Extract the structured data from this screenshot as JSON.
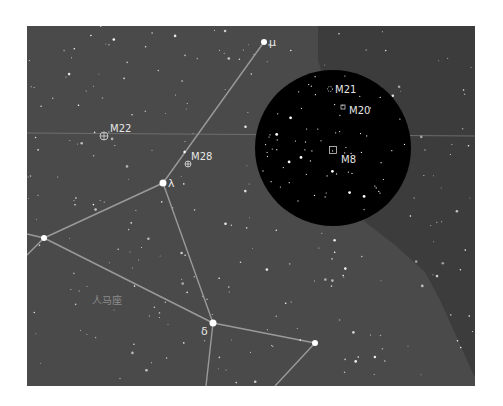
{
  "map": {
    "type": "star-chart",
    "constellation_label": "人马座",
    "frame": {
      "x": 27,
      "y": 26,
      "width": 448,
      "height": 360
    },
    "colors": {
      "page_background": "#ffffff",
      "sky": "#4a4a4a",
      "sky_dark_region": "#3c3c3c",
      "eyepiece_field": "#000000",
      "constellation_line": "#9a9a9a",
      "ecliptic_line": "#777777",
      "star": "#ffffff",
      "label": "#e6e6e6",
      "constellation_label_color": "#8a8a8a"
    },
    "eyepiece_circle": {
      "cx": 333,
      "cy": 148,
      "r": 78
    },
    "ecliptic": {
      "y_left": 133,
      "y_right": 136
    },
    "named_stars": [
      {
        "id": "mu",
        "label": "μ",
        "x": 264,
        "y": 42,
        "r": 3
      },
      {
        "id": "lambda",
        "label": "λ",
        "x": 163,
        "y": 183,
        "r": 3.5
      },
      {
        "id": "delta",
        "label": "δ",
        "x": 213,
        "y": 323,
        "r": 3.5
      },
      {
        "id": "phi",
        "label": "",
        "x": 44,
        "y": 238,
        "r": 3
      },
      {
        "id": "epsilon",
        "label": "",
        "x": 315,
        "y": 343,
        "r": 3
      }
    ],
    "constellation_lines": [
      {
        "x1": 264,
        "y1": 42,
        "x2": 163,
        "y2": 183
      },
      {
        "x1": 163,
        "y1": 183,
        "x2": 44,
        "y2": 238
      },
      {
        "x1": 163,
        "y1": 183,
        "x2": 213,
        "y2": 323
      },
      {
        "x1": 44,
        "y1": 238,
        "x2": 213,
        "y2": 323
      },
      {
        "x1": 44,
        "y1": 238,
        "x2": 27,
        "y2": 234
      },
      {
        "x1": 44,
        "y1": 238,
        "x2": 27,
        "y2": 255
      },
      {
        "x1": 213,
        "y1": 323,
        "x2": 315,
        "y2": 343
      },
      {
        "x1": 213,
        "y1": 323,
        "x2": 206,
        "y2": 386
      },
      {
        "x1": 315,
        "y1": 343,
        "x2": 275,
        "y2": 386
      }
    ],
    "deep_sky_objects": [
      {
        "id": "M22",
        "label": "M22",
        "symbol": "globular-cluster",
        "x": 104,
        "y": 136,
        "label_x": 110,
        "label_y": 132
      },
      {
        "id": "M28",
        "label": "M28",
        "symbol": "globular-cluster",
        "x": 188,
        "y": 164,
        "label_x": 191,
        "label_y": 160
      },
      {
        "id": "M21",
        "label": "M21",
        "symbol": "open-cluster",
        "x": 330,
        "y": 89,
        "label_x": 335,
        "label_y": 93
      },
      {
        "id": "M20",
        "label": "M20",
        "symbol": "nebula",
        "x": 343,
        "y": 107,
        "label_x": 349,
        "label_y": 114
      },
      {
        "id": "M8",
        "label": "M8",
        "symbol": "nebula",
        "x": 333,
        "y": 150,
        "label_x": 341,
        "label_y": 163
      }
    ],
    "constellation_name_pos": {
      "x": 92,
      "y": 304
    }
  }
}
